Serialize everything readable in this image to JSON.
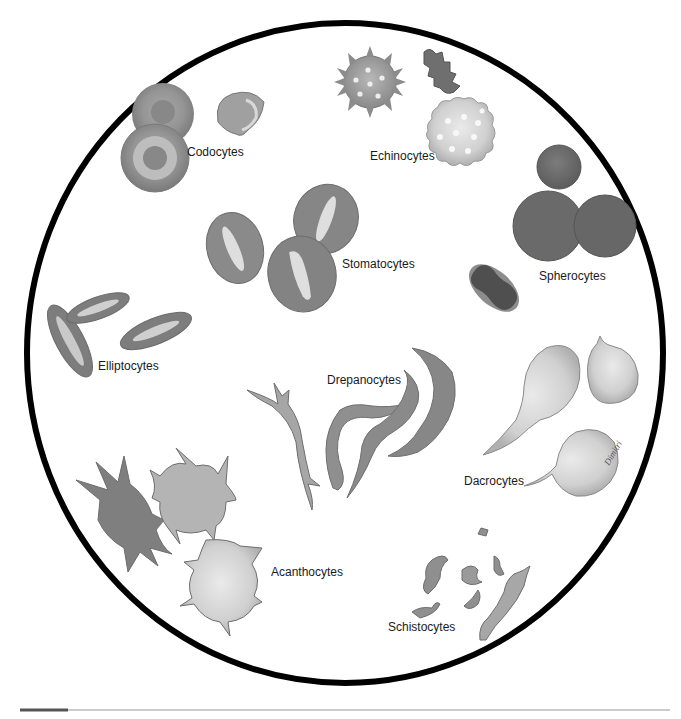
{
  "figure": {
    "signature": "Dimitri",
    "field_circle": {
      "cx": 345,
      "cy": 353,
      "rx": 318,
      "ry": 330,
      "stroke": "#000000",
      "stroke_width": 6
    },
    "footer_rule": {
      "y": 710,
      "x1": 20,
      "x2": 670,
      "accent_x2": 68,
      "accent_color": "#555555",
      "line_color": "#999999"
    }
  },
  "labels": [
    {
      "id": "codocytes",
      "text": "Codocytes",
      "x": 187,
      "y": 156
    },
    {
      "id": "echinocytes",
      "text": "Echinocytes",
      "x": 370,
      "y": 160
    },
    {
      "id": "stomatocytes",
      "text": "Stomatocytes",
      "x": 342,
      "y": 268
    },
    {
      "id": "spherocytes",
      "text": "Spherocytes",
      "x": 539,
      "y": 280
    },
    {
      "id": "elliptocytes",
      "text": "Elliptocytes",
      "x": 98,
      "y": 370
    },
    {
      "id": "drepanocytes",
      "text": "Drepanocytes",
      "x": 327,
      "y": 384
    },
    {
      "id": "dacrocytes",
      "text": "Dacrocytes",
      "x": 464,
      "y": 485
    },
    {
      "id": "acanthocytes",
      "text": "Acanthocytes",
      "x": 271,
      "y": 576
    },
    {
      "id": "schistocytes",
      "text": "Schistocytes",
      "x": 388,
      "y": 631
    }
  ],
  "colors": {
    "cell_dark": "#6f6f6f",
    "cell_mid": "#8d8d8d",
    "cell_light": "#c4c4c4",
    "cell_pale": "#dcdcdc",
    "cell_outline": "#5a5a5a",
    "highlight": "#eeeeee"
  }
}
